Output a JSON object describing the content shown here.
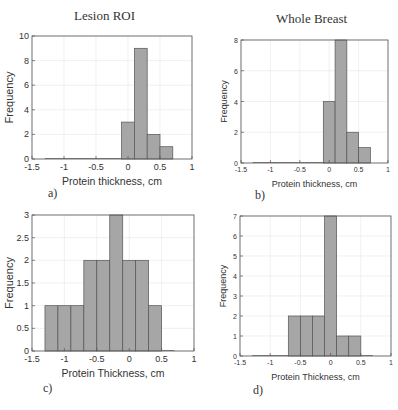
{
  "column_titles": {
    "left": "Lesion ROI",
    "right": "Whole Breast"
  },
  "chart_data": [
    {
      "id": "a",
      "type": "bar",
      "panel_label": "a)",
      "title": "Lesion ROI",
      "xlabel": "Protein thickness, cm",
      "ylabel": "Frequency",
      "xlim": [
        -1.5,
        1
      ],
      "ylim": [
        0,
        10
      ],
      "xticks": [
        "-1.5",
        "-1",
        "-0.5",
        "0",
        "0.5",
        "1"
      ],
      "yticks": [
        "0",
        "2",
        "4",
        "6",
        "8",
        "10"
      ],
      "bin_edges": [
        -0.1,
        0.1,
        0.3,
        0.5,
        0.7
      ],
      "values": [
        3,
        9,
        2,
        1
      ],
      "grid": true
    },
    {
      "id": "b",
      "type": "bar",
      "panel_label": "b)",
      "title": "Whole Breast",
      "xlabel": "Protein thickness, cm",
      "ylabel": "Frequency",
      "xlim": [
        -1.5,
        1
      ],
      "ylim": [
        0,
        8
      ],
      "xticks": [
        "-1.5",
        "-1",
        "-0.5",
        "0",
        "0.5",
        "1"
      ],
      "yticks": [
        "0",
        "2",
        "4",
        "6",
        "8"
      ],
      "bin_edges": [
        -0.1,
        0.1,
        0.3,
        0.5,
        0.7
      ],
      "values": [
        4,
        8,
        2,
        1
      ],
      "grid": true
    },
    {
      "id": "c",
      "type": "bar",
      "panel_label": "c)",
      "title": "Lesion ROI",
      "xlabel": "Protein Thickness, cm",
      "ylabel": "Frequency",
      "xlim": [
        -1.5,
        1
      ],
      "ylim": [
        0,
        3
      ],
      "xticks": [
        "-1.5",
        "-1",
        "-0.5",
        "0",
        "0.5",
        "1"
      ],
      "yticks": [
        "0",
        "0.5",
        "1",
        "1.5",
        "2",
        "2.5",
        "3"
      ],
      "bin_edges": [
        -1.3,
        -1.1,
        -0.9,
        -0.7,
        -0.5,
        -0.3,
        -0.1,
        0.1,
        0.3,
        0.5
      ],
      "values": [
        1,
        1,
        1,
        2,
        2,
        3,
        2,
        2,
        1
      ],
      "grid": true
    },
    {
      "id": "d",
      "type": "bar",
      "panel_label": "d)",
      "title": "Whole Breast",
      "xlabel": "Protein Thickness, cm",
      "ylabel": "Frequency",
      "xlim": [
        -1.5,
        1
      ],
      "ylim": [
        0,
        7
      ],
      "xticks": [
        "-1.5",
        "-1",
        "-0.5",
        "0",
        "0.5",
        "1"
      ],
      "yticks": [
        "0",
        "1",
        "2",
        "3",
        "4",
        "5",
        "6",
        "7"
      ],
      "bin_edges": [
        -0.7,
        -0.5,
        -0.3,
        -0.1,
        0.1,
        0.3,
        0.5
      ],
      "values": [
        2,
        2,
        2,
        7,
        1,
        1
      ],
      "grid": true
    }
  ],
  "colors": {
    "bar_fill": "#a6a6a6",
    "bar_edge": "#555555",
    "axis": "#555555",
    "grid": "#e6e6e6"
  }
}
